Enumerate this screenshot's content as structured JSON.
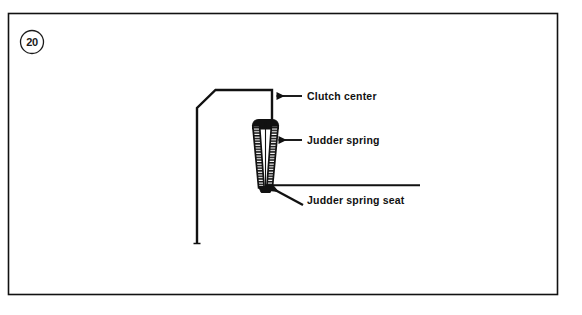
{
  "figure": {
    "badge_number": "20",
    "background_color": "#ffffff",
    "line_color": "#111111",
    "frame": {
      "x": 8,
      "y": 13,
      "width": 550,
      "height": 282
    }
  },
  "callouts": [
    {
      "id": "clutch-center",
      "label": "Clutch center",
      "arrow_type": "horizontal",
      "text_x": 307,
      "text_y": 100,
      "arrow_tip_x": 274,
      "arrow_tip_y": 96,
      "arrow_tail_x": 302,
      "arrow_tail_y": 96
    },
    {
      "id": "judder-spring",
      "label": "Judder spring",
      "arrow_type": "horizontal",
      "text_x": 307,
      "text_y": 144,
      "arrow_tip_x": 276,
      "arrow_tip_y": 140,
      "arrow_tail_x": 302,
      "arrow_tail_y": 140
    },
    {
      "id": "judder-spring-seat",
      "label": "Judder spring seat",
      "arrow_type": "diagonal",
      "text_x": 307,
      "text_y": 204,
      "arrow_tip_x": 268,
      "arrow_tip_y": 186,
      "arrow_tail_x": 303,
      "arrow_tail_y": 205
    }
  ],
  "parts": {
    "clutch_center": {
      "name": "Clutch center",
      "outline_points": "197,243 197,108 215,90 272,90 272,122"
    },
    "judder_spring": {
      "name": "Judder spring",
      "hatch_band_count": 2,
      "hatch_tick_count": 26,
      "top_y": 120,
      "bottom_y": 188,
      "top_width": 26,
      "bottom_width": 12
    },
    "judder_spring_seat": {
      "name": "Judder spring seat",
      "line_start_x": 265,
      "line_end_x": 420,
      "line_y": 185
    }
  }
}
